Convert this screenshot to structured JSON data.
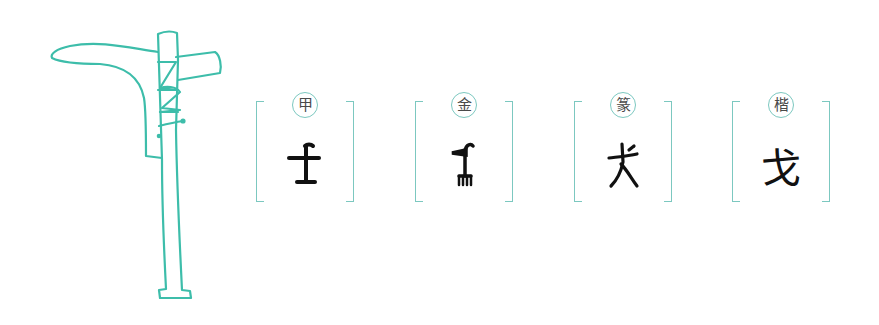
{
  "illustration": {
    "subject": "ge-dagger-axe",
    "stroke_color": "#3dbdaa"
  },
  "colors": {
    "accent": "#7cc8c0",
    "ink": "#111111",
    "badge_text": "#4a4a4a"
  },
  "panels": [
    {
      "label": "甲",
      "script": "oracle-bone",
      "character": "戈",
      "left": 256
    },
    {
      "label": "金",
      "script": "bronze",
      "character": "戈",
      "left": 415
    },
    {
      "label": "篆",
      "script": "seal",
      "character": "戈",
      "left": 574
    },
    {
      "label": "楷",
      "script": "regular",
      "character": "戈",
      "left": 732
    }
  ]
}
